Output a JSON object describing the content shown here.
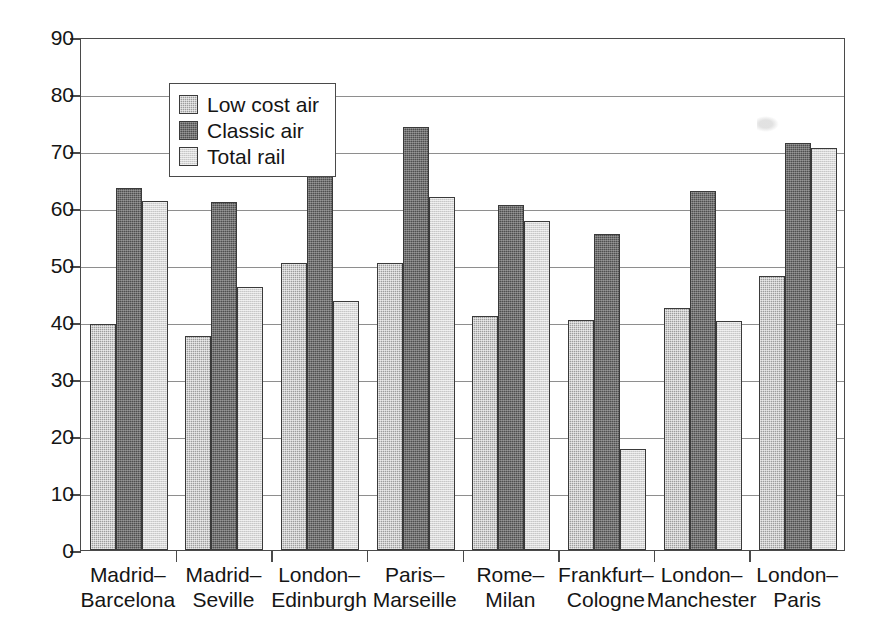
{
  "chart_data": {
    "type": "bar",
    "title": "",
    "xlabel": "",
    "ylabel": "€ per seat",
    "ylim": [
      0,
      90
    ],
    "yticks": [
      0,
      10,
      20,
      30,
      40,
      50,
      60,
      70,
      80,
      90
    ],
    "grid": true,
    "legend_position": "top-left",
    "categories": [
      "Madrid–Barcelona",
      "Madrid–Seville",
      "London–Edinburgh",
      "Paris–Marseille",
      "Rome–Milan",
      "Frankfurt–Cologne",
      "London–Manchester",
      "London–Paris"
    ],
    "category_lines": [
      [
        "Madrid–",
        "Barcelona"
      ],
      [
        "Madrid–",
        "Seville"
      ],
      [
        "London–",
        "Edinburgh"
      ],
      [
        "Paris–",
        "Marseille"
      ],
      [
        "Rome–",
        "Milan"
      ],
      [
        "Frankfurt–",
        "Cologne"
      ],
      [
        "London–",
        "Manchester"
      ],
      [
        "London–",
        "Paris"
      ]
    ],
    "series": [
      {
        "name": "Low cost air",
        "color": "#9d9d9d",
        "values": [
          39.7,
          37.6,
          50.3,
          50.4,
          41.1,
          40.3,
          42.4,
          48.0
        ]
      },
      {
        "name": "Classic air",
        "color": "#4f4f4f",
        "values": [
          63.5,
          61.0,
          77.7,
          74.3,
          60.5,
          55.5,
          62.9,
          71.4
        ]
      },
      {
        "name": "Total rail",
        "color": "#d8d8d8",
        "values": [
          61.3,
          46.1,
          43.6,
          62.0,
          57.7,
          17.8,
          40.1,
          70.5
        ]
      }
    ]
  },
  "legend": {
    "items": [
      {
        "label": "Low cost air",
        "swatch": "#9d9d9d"
      },
      {
        "label": "Classic air",
        "swatch": "#4f4f4f"
      },
      {
        "label": "Total rail",
        "swatch": "#d8d8d8"
      }
    ]
  },
  "axis": {
    "y_title": "€ per seat",
    "y_tick_labels": [
      "0",
      "10",
      "20",
      "30",
      "40",
      "50",
      "60",
      "70",
      "80",
      "90"
    ]
  }
}
